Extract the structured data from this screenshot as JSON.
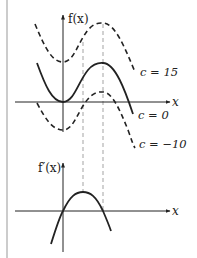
{
  "figure": {
    "top_plot": {
      "y_axis_label": "f(x)",
      "x_axis_label": "x",
      "curves": [
        {
          "name": "c = 15",
          "label": "c = 15",
          "style": "dashed"
        },
        {
          "name": "c = 0",
          "label": "c = 0",
          "style": "solid"
        },
        {
          "name": "c = -10",
          "label": "c = −10",
          "style": "dashed"
        }
      ]
    },
    "bottom_plot": {
      "y_axis_label": "f′(x)",
      "x_axis_label": "x",
      "curve": {
        "name": "derivative",
        "style": "solid"
      }
    },
    "colors": {
      "ink": "#222222",
      "guide": "#888888",
      "border": "#999999"
    }
  }
}
